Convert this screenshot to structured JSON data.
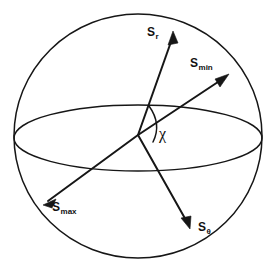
{
  "figure": {
    "kind": "sphere-vector-diagram",
    "background_color": "#ffffff",
    "line_color": "#161616"
  },
  "sphere": {
    "name": "sphere-outline",
    "center_x": 138,
    "center_y": 136,
    "radius_x": 124,
    "radius_y": 122
  },
  "equator": {
    "name": "equatorial-ellipse",
    "center_x": 138,
    "center_y": 138,
    "radius_x": 124,
    "radius_y": 33
  },
  "origin": {
    "x": 138,
    "y": 135
  },
  "vectors": [
    {
      "id": "s-r",
      "label_main": "S",
      "label_sub": "r",
      "tip_x": 173,
      "tip_y": 31,
      "tail_x": 138,
      "tail_y": 135
    },
    {
      "id": "s-min",
      "label_main": "S",
      "label_sub": "min",
      "tip_x": 229,
      "tip_y": 74,
      "tail_x": 138,
      "tail_y": 135
    },
    {
      "id": "s-max",
      "label_main": "S",
      "label_sub": "max",
      "tip_x": 43,
      "tip_y": 205,
      "tail_x": 138,
      "tail_y": 135
    },
    {
      "id": "s-theta",
      "label_main": "S",
      "label_sub": "θ",
      "tip_x": 190,
      "tip_y": 229,
      "tail_x": 138,
      "tail_y": 135
    }
  ],
  "angle": {
    "id": "angle-chi",
    "symbol": "χ",
    "between": [
      "s-r",
      "s-min"
    ]
  }
}
